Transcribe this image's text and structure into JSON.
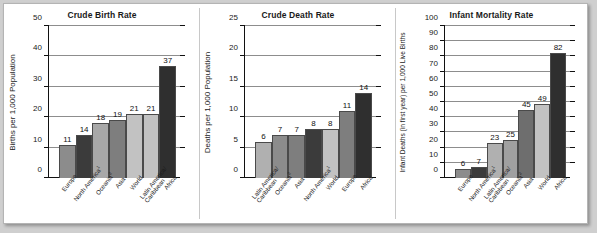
{
  "chart_data": [
    {
      "type": "bar",
      "title": "Crude Birth Rate",
      "xlabel": "",
      "ylabel": "Births per 1,000 Population",
      "ylim": [
        0,
        50
      ],
      "yticks": [
        0,
        10,
        20,
        30,
        40,
        50
      ],
      "grid": true,
      "legend": "none",
      "categories": [
        "Europe",
        "North America¹",
        "Oceania²",
        "Asia",
        "World",
        "Latin America/ Caribbean",
        "Africa"
      ],
      "category_lines": [
        [
          "Europe"
        ],
        [
          "North America¹"
        ],
        [
          "Oceania²"
        ],
        [
          "Asia"
        ],
        [
          "World"
        ],
        [
          "Latin America/",
          "Caribbean"
        ],
        [
          "Africa"
        ]
      ],
      "values": [
        11,
        14,
        18,
        19,
        21,
        21,
        37
      ],
      "bar_colors": [
        "#8c8c8c",
        "#3b3b3b",
        "#a8a8a8",
        "#7e7e7e",
        "#c2c2c2",
        "#c2c2c2",
        "#2f2f2f"
      ]
    },
    {
      "type": "bar",
      "title": "Crude Death Rate",
      "xlabel": "",
      "ylabel": "Deaths per 1,000 Population",
      "ylim": [
        0,
        25
      ],
      "yticks": [
        0,
        5,
        10,
        15,
        20,
        25
      ],
      "grid": true,
      "legend": "none",
      "categories": [
        "Latin America/ Caribbean",
        "Oceania²",
        "Asia",
        "North America¹",
        "World",
        "Europe",
        "Africa"
      ],
      "category_lines": [
        [
          "Latin America/",
          "Caribbean"
        ],
        [
          "Oceania²"
        ],
        [
          "Asia"
        ],
        [
          "North America¹"
        ],
        [
          "World"
        ],
        [
          "Europe"
        ],
        [
          "Africa"
        ]
      ],
      "values": [
        6,
        7,
        7,
        8,
        8,
        11,
        14
      ],
      "bar_colors": [
        "#b0b0b0",
        "#8c8c8c",
        "#7e7e7e",
        "#3b3b3b",
        "#c2c2c2",
        "#7e7e7e",
        "#2f2f2f"
      ]
    },
    {
      "type": "bar",
      "title": "Infant Mortality Rate",
      "xlabel": "",
      "ylabel": "Infant Deaths (in first year) per 1,000 Live Births",
      "ylim": [
        0,
        100
      ],
      "yticks": [
        0,
        10,
        20,
        30,
        40,
        50,
        60,
        70,
        80,
        90,
        100
      ],
      "grid": true,
      "legend": "none",
      "categories": [
        "Europe",
        "North America¹",
        "Latin America/ Caribbean",
        "Oceania²",
        "Asia",
        "World",
        "Africa"
      ],
      "category_lines": [
        [
          "Europe"
        ],
        [
          "North America¹"
        ],
        [
          "Latin America/",
          "Caribbean"
        ],
        [
          "Oceania²"
        ],
        [
          "Asia"
        ],
        [
          "World"
        ],
        [
          "Africa"
        ]
      ],
      "values": [
        6,
        7,
        23,
        25,
        45,
        49,
        82
      ],
      "bar_colors": [
        "#8c8c8c",
        "#3b3b3b",
        "#b0b0b0",
        "#a0a0a0",
        "#6e6e6e",
        "#c2c2c2",
        "#2f2f2f"
      ]
    }
  ]
}
